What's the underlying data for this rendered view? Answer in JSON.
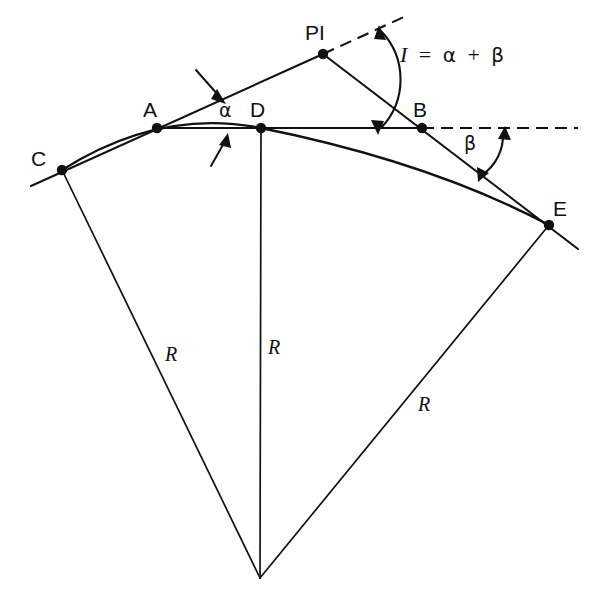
{
  "figure": {
    "background_color": "#ffffff",
    "line_color": "#111111",
    "width": 594,
    "height": 598
  },
  "points": [
    {
      "id": "C",
      "label": "C",
      "x": 62,
      "y": 170,
      "label_x": 31,
      "label_y": 148,
      "role": "curve-start-point"
    },
    {
      "id": "A",
      "label": "A",
      "x": 157,
      "y": 128,
      "label_x": 143,
      "label_y": 99,
      "role": "tangent-point-a"
    },
    {
      "id": "D",
      "label": "D",
      "x": 261,
      "y": 128,
      "label_x": 250,
      "label_y": 99,
      "role": "midpoint-of-curve"
    },
    {
      "id": "B",
      "label": "B",
      "x": 422,
      "y": 128,
      "label_x": 413,
      "label_y": 99,
      "role": "tangent-point-b"
    },
    {
      "id": "E",
      "label": "E",
      "x": 549,
      "y": 225,
      "label_x": 553,
      "label_y": 198,
      "role": "curve-end-point"
    },
    {
      "id": "PI",
      "label": "PI",
      "x": 323,
      "y": 54,
      "label_x": 305,
      "label_y": 22,
      "role": "point-of-intersection"
    },
    {
      "id": "O",
      "label": "",
      "x": 260,
      "y": 578,
      "label_x": 0,
      "label_y": 0,
      "role": "center-of-circle"
    }
  ],
  "radius_labels": [
    {
      "text": "R",
      "x": 165,
      "y": 344,
      "name": "radius-label-left"
    },
    {
      "text": "R",
      "x": 268,
      "y": 337,
      "name": "radius-label-center"
    },
    {
      "text": "R",
      "x": 418,
      "y": 394,
      "name": "radius-label-right"
    }
  ],
  "angle_labels": {
    "alpha": {
      "text": "α",
      "x": 219,
      "y": 101
    },
    "beta": {
      "text": "β",
      "x": 464,
      "y": 134
    }
  },
  "formula": {
    "parts": {
      "symbol": "I",
      "equals": "=",
      "alpha": "α",
      "plus": "+",
      "beta": "β"
    },
    "full_text": "I = α + β",
    "x": 400,
    "y": 44
  },
  "segments": {
    "chord_ab": {
      "from": "A",
      "to": "B",
      "style": "solid"
    },
    "tangent_back": {
      "from": "C",
      "to": "PI",
      "style": "solid",
      "note": "back tangent through A"
    },
    "tangent_forward": {
      "from": "PI",
      "to": "E",
      "style": "solid",
      "note": "forward tangent through B"
    },
    "radius_left": {
      "from": "C",
      "to": "O",
      "style": "solid"
    },
    "radius_middle": {
      "from": "D",
      "to": "O",
      "style": "solid"
    },
    "radius_right": {
      "from": "E",
      "to": "O",
      "style": "solid"
    },
    "curve_cde": {
      "from": "C",
      "through": "D",
      "to": "E",
      "style": "solid-arc"
    },
    "dashed_pi_extension": {
      "from": "PI",
      "to_x": 406,
      "to_y": 16,
      "style": "dashed"
    },
    "dashed_chord_extension": {
      "from": "B",
      "to_x": 578,
      "to_y": 128,
      "style": "dashed"
    }
  },
  "arrows": [
    {
      "name": "pointer-to-back-tangent",
      "from_x": 198,
      "from_y": 72,
      "to_x": 224,
      "to_y": 101
    },
    {
      "name": "pointer-to-chord-ab",
      "from_x": 212,
      "from_y": 165,
      "to_x": 228,
      "to_y": 133
    },
    {
      "name": "angle-arc-I",
      "double_headed": true
    },
    {
      "name": "angle-arc-beta",
      "double_headed": true
    }
  ]
}
